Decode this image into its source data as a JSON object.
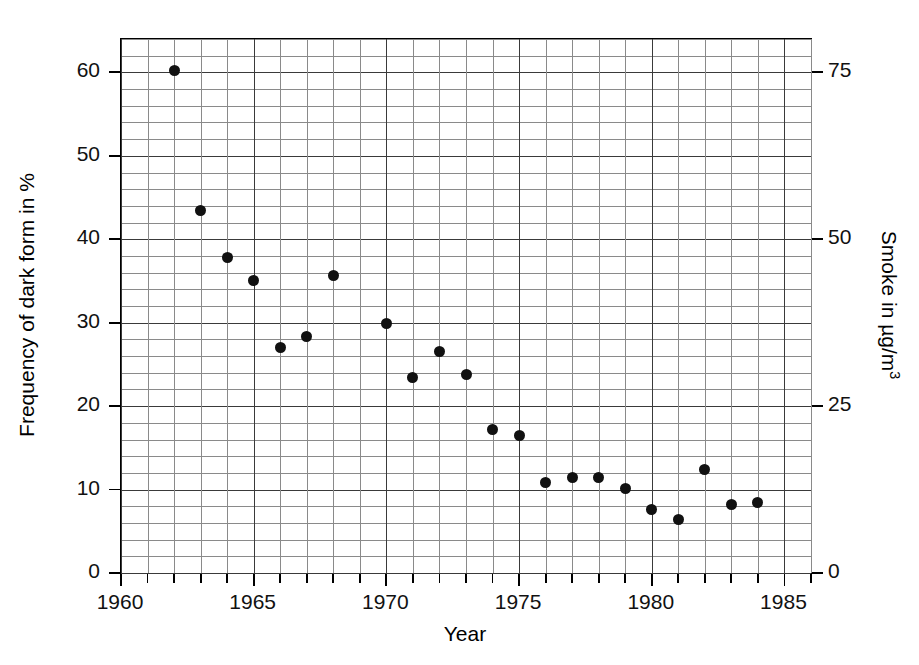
{
  "chart_data": {
    "type": "scatter",
    "title": "",
    "xlabel": "Year",
    "ylabel": "Frequency of dark form in %",
    "y2label": "Smoke in µg/m³",
    "xlim": [
      1960,
      1986
    ],
    "ylim": [
      0,
      64
    ],
    "y2lim": [
      0,
      80
    ],
    "grid": true,
    "grid_minor_x_step": 1,
    "grid_minor_y_step": 2,
    "grid_major_x_step": 5,
    "grid_major_y_step": 10,
    "legend": "none",
    "marker": "filled-circle",
    "marker_color": "#111111",
    "xticks": [
      1960,
      1965,
      1970,
      1975,
      1980,
      1985
    ],
    "xticklabels": [
      "1960",
      "1965",
      "1970",
      "1975",
      "1980",
      "1985"
    ],
    "yticks": [
      0,
      10,
      20,
      30,
      40,
      50,
      60
    ],
    "yticklabels": [
      "0",
      "10",
      "20",
      "30",
      "40",
      "50",
      "60"
    ],
    "y2ticks": [
      0,
      25,
      50,
      75
    ],
    "y2ticklabels": [
      "0",
      "25",
      "50",
      "75"
    ],
    "x": [
      1962,
      1963,
      1964,
      1965,
      1966,
      1967,
      1968,
      1970,
      1971,
      1972,
      1973,
      1974,
      1975,
      1976,
      1977,
      1978,
      1979,
      1980,
      1981,
      1982,
      1983,
      1984
    ],
    "y": [
      60.2,
      43.4,
      37.8,
      35.0,
      27.0,
      28.3,
      35.7,
      29.9,
      23.4,
      26.5,
      23.8,
      17.2,
      16.5,
      10.9,
      11.5,
      11.4,
      10.1,
      7.6,
      6.4,
      12.4,
      8.2,
      8.4
    ],
    "points": [
      {
        "year": 1962,
        "frequency": 60.2
      },
      {
        "year": 1963,
        "frequency": 43.4
      },
      {
        "year": 1964,
        "frequency": 37.8
      },
      {
        "year": 1965,
        "frequency": 35.0
      },
      {
        "year": 1966,
        "frequency": 27.0
      },
      {
        "year": 1967,
        "frequency": 28.3
      },
      {
        "year": 1968,
        "frequency": 35.7
      },
      {
        "year": 1970,
        "frequency": 29.9
      },
      {
        "year": 1971,
        "frequency": 23.4
      },
      {
        "year": 1972,
        "frequency": 26.5
      },
      {
        "year": 1973,
        "frequency": 23.8
      },
      {
        "year": 1974,
        "frequency": 17.2
      },
      {
        "year": 1975,
        "frequency": 16.5
      },
      {
        "year": 1976,
        "frequency": 10.9
      },
      {
        "year": 1977,
        "frequency": 11.5
      },
      {
        "year": 1978,
        "frequency": 11.4
      },
      {
        "year": 1979,
        "frequency": 10.1
      },
      {
        "year": 1980,
        "frequency": 7.6
      },
      {
        "year": 1981,
        "frequency": 6.4
      },
      {
        "year": 1982,
        "frequency": 12.4
      },
      {
        "year": 1983,
        "frequency": 8.2
      },
      {
        "year": 1984,
        "frequency": 8.4
      }
    ]
  },
  "axis_titles": {
    "x": "Year",
    "y_left": "Frequency of dark form in %",
    "y_right_pre": "Smoke in µg/m",
    "y_right_sup": "3"
  }
}
